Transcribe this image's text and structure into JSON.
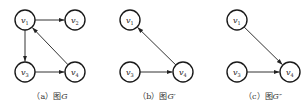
{
  "graphs": [
    {
      "id": "a",
      "caption_prefix": "（a）图",
      "caption_name": "G",
      "nodes": [
        {
          "id": "v1",
          "label": "v",
          "sub": "1",
          "x": 25,
          "y": 20
        },
        {
          "id": "v2",
          "label": "v",
          "sub": "2",
          "x": 75,
          "y": 20
        },
        {
          "id": "v3",
          "label": "v",
          "sub": "3",
          "x": 25,
          "y": 72
        },
        {
          "id": "v4",
          "label": "v",
          "sub": "4",
          "x": 75,
          "y": 72
        }
      ],
      "edges": [
        {
          "from": "v1",
          "to": "v2"
        },
        {
          "from": "v1",
          "to": "v3"
        },
        {
          "from": "v3",
          "to": "v4"
        },
        {
          "from": "v4",
          "to": "v1"
        }
      ]
    },
    {
      "id": "b",
      "caption_prefix": "（b）图",
      "caption_name": "G′",
      "nodes": [
        {
          "id": "v1",
          "label": "v",
          "sub": "1",
          "x": 130,
          "y": 20
        },
        {
          "id": "v3",
          "label": "v",
          "sub": "3",
          "x": 130,
          "y": 72
        },
        {
          "id": "v4",
          "label": "v",
          "sub": "4",
          "x": 183,
          "y": 72
        }
      ],
      "edges": [
        {
          "from": "v3",
          "to": "v4"
        },
        {
          "from": "v4",
          "to": "v1"
        }
      ]
    },
    {
      "id": "c",
      "caption_prefix": "（c）图",
      "caption_name": "G″",
      "nodes": [
        {
          "id": "v1",
          "label": "v",
          "sub": "1",
          "x": 237,
          "y": 20
        },
        {
          "id": "v3",
          "label": "v",
          "sub": "3",
          "x": 237,
          "y": 72
        },
        {
          "id": "v4",
          "label": "v",
          "sub": "4",
          "x": 290,
          "y": 72
        }
      ],
      "edges": [
        {
          "from": "v1",
          "to": "v4"
        },
        {
          "from": "v3",
          "to": "v4"
        }
      ]
    }
  ],
  "captions": [
    {
      "x": 50,
      "y": 99
    },
    {
      "x": 157,
      "y": 99
    },
    {
      "x": 263,
      "y": 99
    }
  ],
  "node_radius": 10,
  "colors": {
    "stroke": "#1a1a1a",
    "edge": "#333333",
    "background": "#ffffff"
  }
}
